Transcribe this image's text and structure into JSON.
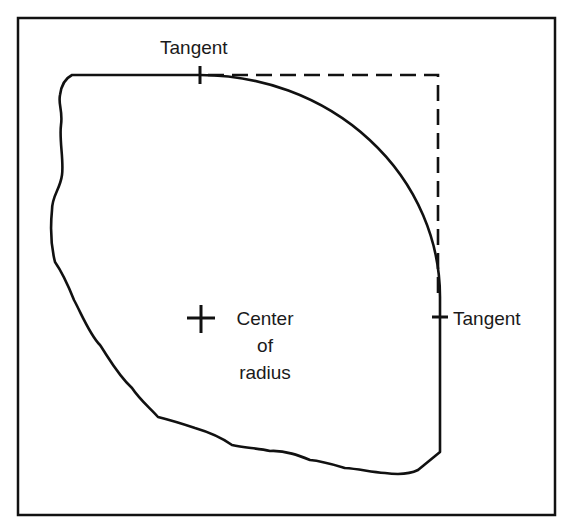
{
  "diagram": {
    "labels": {
      "top_tangent": "Tangent",
      "right_tangent": "Tangent",
      "center_line1": "Center",
      "center_line2": "of",
      "center_line3": "radius"
    },
    "colors": {
      "line": "#111111",
      "background": "#ffffff"
    }
  }
}
